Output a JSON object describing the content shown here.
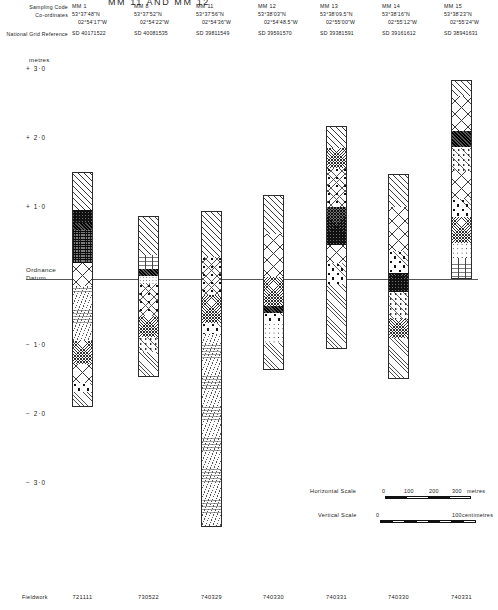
{
  "figure": {
    "title": "MM 11 AND MM 12",
    "units_label": "metres",
    "datum_label_line1": "Ordnance",
    "datum_label_line2": "Datum"
  },
  "header": {
    "row_labels": [
      "Sampling Code",
      "Co-ordinates",
      "National Grid Reference"
    ],
    "columns": [
      {
        "code": "MM 1",
        "lat": "53°37'48\"N",
        "lon": "02°54'17\"W",
        "ngr": "SD 40171522",
        "fieldwork": "721111"
      },
      {
        "code": "MM 8",
        "lat": "53°37'52\"N",
        "lon": "02°54'22\"W",
        "ngr": "SD 40081535",
        "fieldwork": "730522"
      },
      {
        "code": "MM 11",
        "lat": "53°37'56\"N",
        "lon": "02°54'36\"W",
        "ngr": "SD 39811549",
        "fieldwork": "740329"
      },
      {
        "code": "MM 12",
        "lat": "53°38'03\"N",
        "lon": "02°54'48.5\"W",
        "ngr": "SD 39591570",
        "fieldwork": "740330"
      },
      {
        "code": "MM 13",
        "lat": "53°38'09.5\"N",
        "lon": "02°55'00\"W",
        "ngr": "SD 39381591",
        "fieldwork": "740331"
      },
      {
        "code": "MM 14",
        "lat": "53°38'16\"N",
        "lon": "02°55'12\"W",
        "ngr": "SD 39161612",
        "fieldwork": "740330"
      },
      {
        "code": "MM 15",
        "lat": "53°38'23\"N",
        "lon": "02°55'24\"W",
        "ngr": "SD 38941631",
        "fieldwork": "740331"
      }
    ],
    "footer_label": "Fieldwork"
  },
  "axis": {
    "ticks": [
      {
        "label": "+ 3·0",
        "value": 3.0
      },
      {
        "label": "+ 2·0",
        "value": 2.0
      },
      {
        "label": "+ 1·0",
        "value": 1.0
      },
      {
        "label": "− 1·0",
        "value": -1.0
      },
      {
        "label": "− 2·0",
        "value": -2.0
      },
      {
        "label": "− 3·0",
        "value": -3.0
      }
    ],
    "datum_value": 0.0
  },
  "scales": {
    "horizontal": {
      "label": "Horizontal Scale",
      "zero": "0",
      "ticks": [
        "100",
        "200",
        "300"
      ],
      "unit": "metres"
    },
    "vertical": {
      "label": "Vertical Scale",
      "zero": "0",
      "ticks": [
        "100"
      ],
      "unit": "centimetres"
    }
  },
  "chart_data": {
    "type": "column-section",
    "title": "MM 11 AND MM 12",
    "ylabel": "metres",
    "ylim": [
      -3.6,
      3.3
    ],
    "datum": 0.0,
    "columns": [
      {
        "code": "MM 1",
        "top_m": 1.55,
        "base_m": -1.85,
        "beds": [
          {
            "from_m": 1.55,
            "to_m": 1.02,
            "pattern": "hatch"
          },
          {
            "from_m": 1.02,
            "to_m": 0.82,
            "pattern": "dark"
          },
          {
            "from_m": 0.82,
            "to_m": 0.72,
            "pattern": "black"
          },
          {
            "from_m": 0.72,
            "to_m": 0.24,
            "pattern": "peat"
          },
          {
            "from_m": 0.24,
            "to_m": -0.08,
            "pattern": "crosshatch"
          },
          {
            "from_m": -0.08,
            "to_m": -0.88,
            "pattern": "silt"
          },
          {
            "from_m": -0.88,
            "to_m": -1.22,
            "pattern": "checker"
          },
          {
            "from_m": -1.22,
            "to_m": -1.5,
            "pattern": "crosshatch"
          },
          {
            "from_m": -1.5,
            "to_m": -1.62,
            "pattern": "gravel"
          },
          {
            "from_m": -1.62,
            "to_m": -1.85,
            "pattern": "hatch-fine"
          }
        ]
      },
      {
        "code": "MM 8",
        "top_m": 0.92,
        "base_m": -1.42,
        "beds": [
          {
            "from_m": 0.92,
            "to_m": 0.36,
            "pattern": "hatch"
          },
          {
            "from_m": 0.36,
            "to_m": 0.16,
            "pattern": "clay"
          },
          {
            "from_m": 0.16,
            "to_m": 0.06,
            "pattern": "black"
          },
          {
            "from_m": 0.06,
            "to_m": -0.06,
            "pattern": "stipple"
          },
          {
            "from_m": -0.06,
            "to_m": -0.52,
            "pattern": "organic"
          },
          {
            "from_m": -0.52,
            "to_m": -0.82,
            "pattern": "checker"
          },
          {
            "from_m": -0.82,
            "to_m": -1.04,
            "pattern": "mottle"
          },
          {
            "from_m": -1.04,
            "to_m": -1.42,
            "pattern": "hatch-fine"
          }
        ]
      },
      {
        "code": "MM 11",
        "top_m": 0.98,
        "base_m": -3.6,
        "beds": [
          {
            "from_m": 0.98,
            "to_m": 0.34,
            "pattern": "hatch"
          },
          {
            "from_m": 0.34,
            "to_m": -0.22,
            "pattern": "organic"
          },
          {
            "from_m": -0.22,
            "to_m": -0.62,
            "pattern": "checker"
          },
          {
            "from_m": -0.62,
            "to_m": -0.78,
            "pattern": "gravel"
          },
          {
            "from_m": -0.78,
            "to_m": -3.6,
            "pattern": "silt"
          }
        ]
      },
      {
        "code": "MM 12",
        "top_m": 1.22,
        "base_m": -1.32,
        "beds": [
          {
            "from_m": 1.22,
            "to_m": 0.66,
            "pattern": "hatch"
          },
          {
            "from_m": 0.66,
            "to_m": 0.04,
            "pattern": "crosshatch"
          },
          {
            "from_m": 0.04,
            "to_m": -0.38,
            "pattern": "checker"
          },
          {
            "from_m": -0.38,
            "to_m": -0.48,
            "pattern": "black"
          },
          {
            "from_m": -0.48,
            "to_m": -0.62,
            "pattern": "gravel"
          },
          {
            "from_m": -0.62,
            "to_m": -0.92,
            "pattern": "sand-dot"
          },
          {
            "from_m": -0.92,
            "to_m": -1.32,
            "pattern": "hatch-fine"
          }
        ]
      },
      {
        "code": "MM 13",
        "top_m": 2.22,
        "base_m": -1.02,
        "beds": [
          {
            "from_m": 2.22,
            "to_m": 1.92,
            "pattern": "hatch"
          },
          {
            "from_m": 1.92,
            "to_m": 1.62,
            "pattern": "checker"
          },
          {
            "from_m": 1.62,
            "to_m": 1.06,
            "pattern": "organic"
          },
          {
            "from_m": 1.06,
            "to_m": 0.5,
            "pattern": "dark"
          },
          {
            "from_m": 0.5,
            "to_m": 0.24,
            "pattern": "crosshatch"
          },
          {
            "from_m": 0.24,
            "to_m": -0.06,
            "pattern": "gravel"
          },
          {
            "from_m": -0.06,
            "to_m": -1.02,
            "pattern": "hatch-fine"
          }
        ]
      },
      {
        "code": "MM 14",
        "top_m": 1.52,
        "base_m": -1.45,
        "beds": [
          {
            "from_m": 1.52,
            "to_m": 1.06,
            "pattern": "hatch"
          },
          {
            "from_m": 1.06,
            "to_m": 0.42,
            "pattern": "crosshatch"
          },
          {
            "from_m": 0.42,
            "to_m": 0.1,
            "pattern": "gravel"
          },
          {
            "from_m": 0.1,
            "to_m": -0.18,
            "pattern": "dark"
          },
          {
            "from_m": -0.18,
            "to_m": -0.56,
            "pattern": "mottle"
          },
          {
            "from_m": -0.56,
            "to_m": -0.84,
            "pattern": "checker"
          },
          {
            "from_m": -0.84,
            "to_m": -1.45,
            "pattern": "hatch-fine"
          }
        ]
      },
      {
        "code": "MM 15",
        "top_m": 2.88,
        "base_m": 0.0,
        "beds": [
          {
            "from_m": 2.88,
            "to_m": 2.66,
            "pattern": "hatch"
          },
          {
            "from_m": 2.66,
            "to_m": 2.16,
            "pattern": "crosshatch"
          },
          {
            "from_m": 2.16,
            "to_m": 1.92,
            "pattern": "black"
          },
          {
            "from_m": 1.92,
            "to_m": 1.58,
            "pattern": "mottle"
          },
          {
            "from_m": 1.58,
            "to_m": 1.18,
            "pattern": "crosshatch"
          },
          {
            "from_m": 1.18,
            "to_m": 0.92,
            "pattern": "gravel"
          },
          {
            "from_m": 0.92,
            "to_m": 0.54,
            "pattern": "checker"
          },
          {
            "from_m": 0.54,
            "to_m": 0.32,
            "pattern": "sand-dot"
          },
          {
            "from_m": 0.32,
            "to_m": 0.0,
            "pattern": "clay"
          }
        ]
      }
    ]
  }
}
